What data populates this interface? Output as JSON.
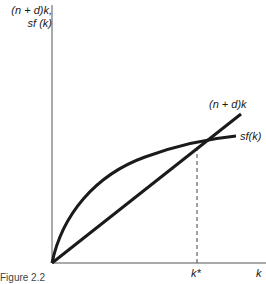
{
  "figure": {
    "caption": "Figure 2.2",
    "y_axis_label_line1": "(n + d)k,",
    "y_axis_label_line2": "sf (k)",
    "x_axis_label": "k",
    "steady_state_label": "k*",
    "line_label": "(n + d)k",
    "curve_label": "sf(k)"
  },
  "colors": {
    "ink": "#1a1a1a",
    "background": "#ffffff"
  }
}
